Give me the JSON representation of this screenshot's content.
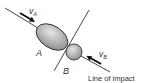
{
  "diagram": {
    "bodies": [
      {
        "id": "A",
        "label": "A",
        "shape": "ellipse"
      },
      {
        "id": "B",
        "label": "B",
        "shape": "circle"
      }
    ],
    "velocities": [
      {
        "body": "A",
        "label_main": "v",
        "label_sub": "A"
      },
      {
        "body": "B",
        "label_main": "v",
        "label_sub": "B"
      }
    ],
    "line_of_impact_label": "Line of impact",
    "colors": {
      "line": "#333333",
      "body_fill_light": "#e6e6e6",
      "body_fill_dark": "#8c8c8c",
      "arrow": "#111111",
      "text": "#333333"
    }
  }
}
